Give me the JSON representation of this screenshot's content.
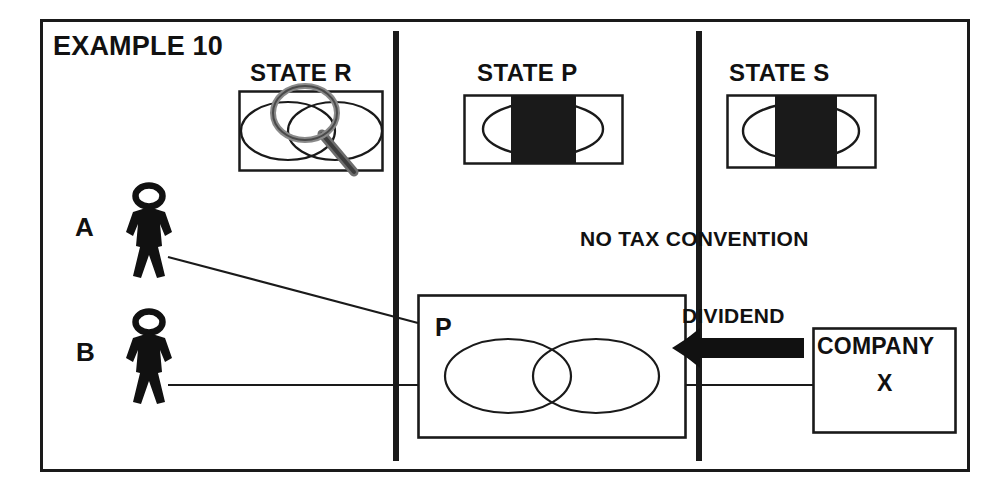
{
  "diagram": {
    "title": "EXAMPLE 10",
    "frame": {
      "border_color": "#1a1a1a"
    },
    "state_boxes": [
      {
        "name": "state-r",
        "label": "STATE R",
        "fill": "transparent",
        "has_magnifier": true,
        "shapes": "two-overlapping-ellipses"
      },
      {
        "name": "state-p",
        "label": "STATE  P",
        "fill": "#1a1a1a",
        "has_magnifier": false,
        "shapes": "ellipse-with-black-band"
      },
      {
        "name": "state-s",
        "label": "STATE S",
        "fill": "#1a1a1a",
        "has_magnifier": false,
        "shapes": "ellipse-with-black-band"
      }
    ],
    "people": [
      {
        "name": "person-a",
        "label": "A"
      },
      {
        "name": "person-b",
        "label": "B"
      }
    ],
    "partnership_box": {
      "label": "P",
      "shapes": "two-overlapping-ellipses"
    },
    "company_box": {
      "line1": "COMPANY",
      "line2": "X"
    },
    "annotations": [
      {
        "name": "no-tax-convention",
        "text": "NO TAX CONVENTION"
      },
      {
        "name": "dividend",
        "text": "DIVIDEND"
      }
    ],
    "colors": {
      "ink": "#1a1a1a",
      "line": "#2b2b2b",
      "fill_black": "#1a1a1a",
      "magnifier_gray": "#777777",
      "background": "#ffffff"
    }
  }
}
